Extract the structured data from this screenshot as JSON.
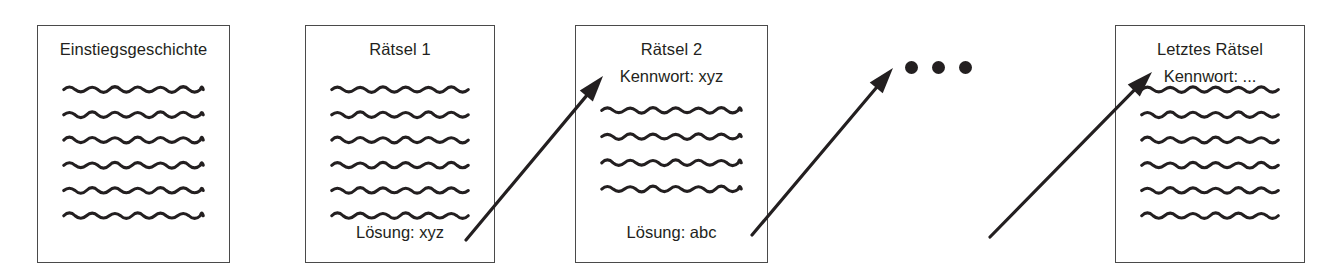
{
  "diagram": {
    "title_text_absent": "",
    "ellipsis": {
      "name": "ellipsis-dots",
      "count": 3,
      "label": "•••"
    },
    "colors": {
      "ink": "#231f20",
      "card_border": "#4a4a4a",
      "background": "#ffffff"
    },
    "cards": [
      {
        "id": "einstiegsgeschichte",
        "title": "Einstiegsgeschichte",
        "subtitle": "",
        "footer": "",
        "wave_lines": 6,
        "x": 37,
        "y": 25,
        "w": 193,
        "h": 238
      },
      {
        "id": "raetsel-1",
        "title": "Rätsel 1",
        "subtitle": "",
        "footer": "Lösung: xyz",
        "wave_lines": 6,
        "x": 305,
        "y": 25,
        "w": 190,
        "h": 238
      },
      {
        "id": "raetsel-2",
        "title": "Rätsel 2",
        "subtitle": "Kennwort: xyz",
        "footer": "Lösung: abc",
        "wave_lines": 4,
        "x": 575,
        "y": 25,
        "w": 193,
        "h": 238
      },
      {
        "id": "letztes-raetsel",
        "title": "Letztes Rätsel",
        "subtitle": "Kennwort: ...",
        "footer": "",
        "wave_lines": 6,
        "x": 1115,
        "y": 25,
        "w": 190,
        "h": 238
      }
    ],
    "arrows": [
      {
        "id": "arrow-raetsel1-to-raetsel2",
        "from_label": "Lösung: xyz",
        "to_label": "Kennwort: xyz",
        "x1": 466,
        "y1": 240,
        "x2": 603,
        "y2": 76
      },
      {
        "id": "arrow-raetsel2-to-ellipsis",
        "from_label": "Lösung: abc",
        "to_label": "•••",
        "x1": 752,
        "y1": 235,
        "x2": 893,
        "y2": 68
      },
      {
        "id": "arrow-ellipsis-to-letztes-raetsel",
        "from_label": "•••",
        "to_label": "Kennwort: ...",
        "x1": 990,
        "y1": 237,
        "x2": 1152,
        "y2": 72
      }
    ]
  }
}
